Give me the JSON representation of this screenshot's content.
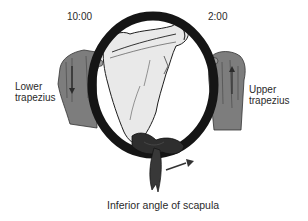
{
  "figure": {
    "clock_labels": {
      "left": "10:00",
      "right": "2:00"
    },
    "muscle_labels": {
      "left": [
        "Lower",
        "trapezius"
      ],
      "right": [
        "Upper",
        "trapezius"
      ]
    },
    "caption": "Inferior angle of scapula",
    "icons": {
      "ring": "steering-ring",
      "scapula": "scapula-bone",
      "left_hand": "left-hand-with-down-arrow",
      "right_hand": "right-hand-with-up-arrow",
      "knot": "tied-band",
      "motion_arrow": "arrow-right"
    },
    "colors": {
      "ring": "#151515",
      "hand": "#7d7d7d",
      "bone": "#e9e9e9",
      "outline": "#1e1e1e",
      "text": "#2a2a2a",
      "background": "#ffffff"
    }
  }
}
